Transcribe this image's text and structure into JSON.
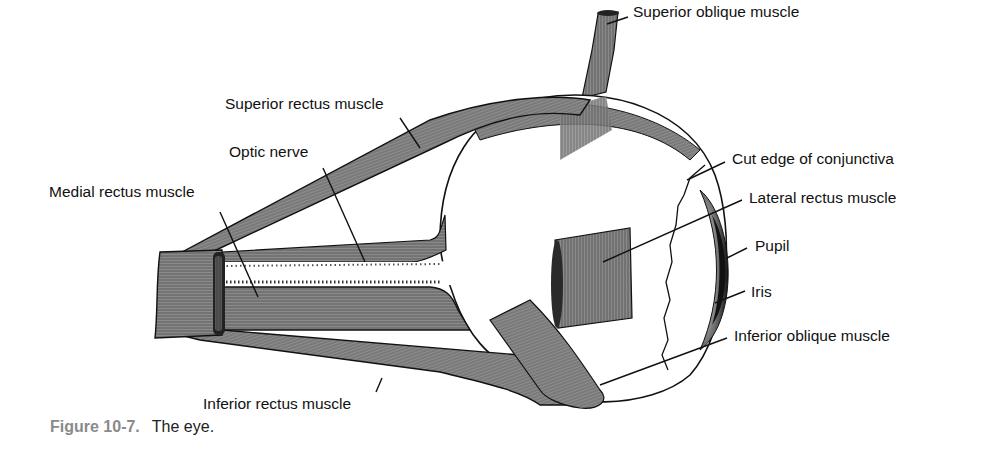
{
  "figure": {
    "title": "The eye",
    "labels": {
      "superior_oblique": "Superior oblique muscle",
      "superior_rectus": "Superior rectus muscle",
      "optic_nerve": "Optic nerve",
      "medial_rectus": "Medial rectus muscle",
      "cut_edge_conjunctiva": "Cut edge of conjunctiva",
      "lateral_rectus": "Lateral rectus muscle",
      "pupil": "Pupil",
      "iris": "Iris",
      "inferior_oblique": "Inferior oblique muscle",
      "inferior_rectus": "Inferior rectus muscle"
    },
    "caption": {
      "number": "Figure 10-7.",
      "text": "The eye."
    }
  },
  "colors": {
    "muscle_fill": "#8c8c8c",
    "muscle_dark": "#3a3a3a",
    "outline": "#111111",
    "caption_number": "#8a8a8a",
    "background": "#ffffff"
  }
}
